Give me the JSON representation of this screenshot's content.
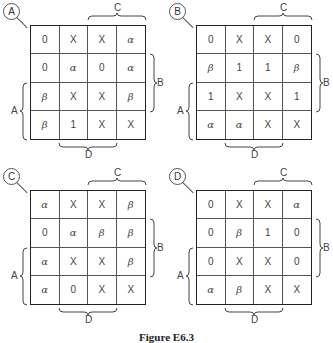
{
  "figure": {
    "caption": "Figure E6.3",
    "maps": [
      {
        "id": "A",
        "rows": [
          [
            "0",
            "X",
            "X",
            "α"
          ],
          [
            "0",
            "α",
            "0",
            "α"
          ],
          [
            "β",
            "X",
            "X",
            "β"
          ],
          [
            "β",
            "1",
            "X",
            "X"
          ]
        ]
      },
      {
        "id": "B",
        "rows": [
          [
            "0",
            "X",
            "X",
            "0"
          ],
          [
            "β",
            "1",
            "1",
            "β"
          ],
          [
            "1",
            "X",
            "X",
            "1"
          ],
          [
            "α",
            "α",
            "X",
            "X"
          ]
        ]
      },
      {
        "id": "C",
        "rows": [
          [
            "α",
            "X",
            "X",
            "β"
          ],
          [
            "0",
            "α",
            "β",
            "β"
          ],
          [
            "α",
            "X",
            "X",
            "β"
          ],
          [
            "α",
            "0",
            "X",
            "X"
          ]
        ]
      },
      {
        "id": "D",
        "rows": [
          [
            "0",
            "X",
            "X",
            "α"
          ],
          [
            "0",
            "β",
            "1",
            "0"
          ],
          [
            "0",
            "X",
            "X",
            "0"
          ],
          [
            "α",
            "β",
            "X",
            "X"
          ]
        ]
      }
    ],
    "variables": {
      "top": "C",
      "right": "B",
      "left": "A",
      "bottom": "D"
    }
  }
}
